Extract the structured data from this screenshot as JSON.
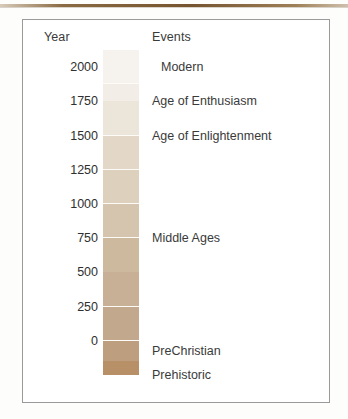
{
  "figure": {
    "top_rule_color": "#7a5a33",
    "frame_border_color": "#9a9a9a",
    "background_color": "#ffffff"
  },
  "headers": {
    "year": "Year",
    "events": "Events"
  },
  "chart_data": {
    "type": "bar",
    "title": "",
    "subtitle": "",
    "xlabel": "Events",
    "ylabel": "Year",
    "ylim": [
      -250,
      2125
    ],
    "grid": false,
    "legend": "none",
    "orientation": "vertical",
    "y_ticks": [
      2000,
      1750,
      1500,
      1250,
      1000,
      750,
      500,
      250,
      0
    ],
    "y_tick_labels": [
      "2000",
      "1750",
      "1500",
      "1250",
      "1000",
      "750",
      "500",
      "250",
      "0"
    ],
    "categories": [
      "Modern",
      "Age of Enthusiasm",
      "Age of Enlightenment",
      "Middle Ages",
      "PreChristian",
      "Prehistoric"
    ],
    "annotations": [
      {
        "label": "Modern",
        "year": 2000
      },
      {
        "label": "Age of Enthusiasm",
        "year": 1750
      },
      {
        "label": "Age of Enlightenment",
        "year": 1500
      },
      {
        "label": "Middle Ages",
        "year": 750
      },
      {
        "label": "PreChristian",
        "year": -75
      },
      {
        "label": "Prehistoric",
        "year": -250
      }
    ],
    "bands": [
      {
        "name": "Modern",
        "year_top": 2125,
        "year_bottom": 1875,
        "color": "#f6f3ee"
      },
      {
        "name": "band-1875-1750",
        "year_top": 1875,
        "year_bottom": 1750,
        "color": "#f2eee7"
      },
      {
        "name": "Age of Enthusiasm",
        "year_top": 1750,
        "year_bottom": 1500,
        "color": "#ece5da"
      },
      {
        "name": "Age of Enlightenment",
        "year_top": 1500,
        "year_bottom": 1250,
        "color": "#e3d8c8"
      },
      {
        "name": "band-1250-1000",
        "year_top": 1250,
        "year_bottom": 1000,
        "color": "#ddd0bd"
      },
      {
        "name": "band-1000-750",
        "year_top": 1000,
        "year_bottom": 750,
        "color": "#d6c5ae"
      },
      {
        "name": "Middle Ages",
        "year_top": 750,
        "year_bottom": 500,
        "color": "#cdb99e"
      },
      {
        "name": "band-500-250",
        "year_top": 500,
        "year_bottom": 250,
        "color": "#c8b096"
      },
      {
        "name": "band-250-0",
        "year_top": 250,
        "year_bottom": 0,
        "color": "#c2a98d"
      },
      {
        "name": "PreChristian",
        "year_top": 0,
        "year_bottom": -150,
        "color": "#bd9f7f"
      },
      {
        "name": "Prehistoric",
        "year_top": -150,
        "year_bottom": -250,
        "color": "#b89068"
      }
    ],
    "separator_color": "#fdfbf7",
    "colormap": "sequential tan / brown (light = recent, dark = ancient)"
  }
}
